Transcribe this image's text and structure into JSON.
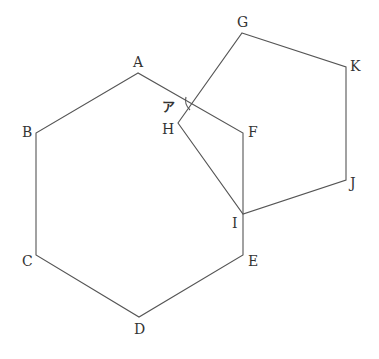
{
  "diagram": {
    "hexagon": {
      "name": "ABCDEF",
      "vertices": [
        {
          "label": "A",
          "x": 138,
          "y": 73,
          "lx": 133,
          "ly": 67
        },
        {
          "label": "B",
          "x": 36,
          "y": 133,
          "lx": 22,
          "ly": 137
        },
        {
          "label": "C",
          "x": 36,
          "y": 255,
          "lx": 22,
          "ly": 266
        },
        {
          "label": "D",
          "x": 139,
          "y": 317,
          "lx": 134,
          "ly": 334
        },
        {
          "label": "E",
          "x": 243,
          "y": 255,
          "lx": 248,
          "ly": 266
        },
        {
          "label": "F",
          "x": 243,
          "y": 133,
          "lx": 248,
          "ly": 137
        }
      ]
    },
    "pentagon": {
      "name": "GKJIH",
      "vertices": [
        {
          "label": "G",
          "x": 242,
          "y": 33,
          "lx": 237,
          "ly": 27
        },
        {
          "label": "K",
          "x": 346,
          "y": 67,
          "lx": 350,
          "ly": 71
        },
        {
          "label": "J",
          "x": 346,
          "y": 180,
          "lx": 350,
          "ly": 188
        },
        {
          "label": "I",
          "x": 243,
          "y": 214,
          "lx": 232,
          "ly": 228
        },
        {
          "label": "H",
          "x": 178,
          "y": 123,
          "lx": 162,
          "ly": 134
        }
      ]
    },
    "angle_marker": {
      "label": "ア",
      "label_x": 162,
      "label_y": 111,
      "arc_path": "M 186 97 Q 184 104 190 110"
    },
    "colors": {
      "stroke": "#555555",
      "text": "#333333",
      "background": "#ffffff"
    }
  }
}
